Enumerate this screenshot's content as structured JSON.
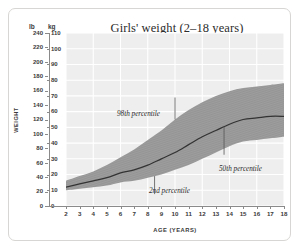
{
  "chart_data": {
    "type": "area",
    "title": "Girls' weight (2–18 years)",
    "xlabel": "AGE (YEARS)",
    "ylabel": "WEIGHT",
    "grid": true,
    "legend_position": "inline-annotations",
    "xlim": [
      2,
      18
    ],
    "x_tick_labels": [
      "2",
      "3",
      "4",
      "5",
      "6",
      "7",
      "8",
      "9",
      "10",
      "11",
      "12",
      "13",
      "14",
      "15",
      "16",
      "17",
      "18"
    ],
    "x": [
      2,
      3,
      4,
      5,
      6,
      7,
      8,
      9,
      10,
      11,
      12,
      13,
      14,
      15,
      16,
      17,
      18
    ],
    "y_axes": [
      {
        "name": "lb",
        "unit_label": "lb",
        "ylim": [
          0,
          240
        ],
        "tick_labels": [
          "240",
          "220",
          "200",
          "180",
          "160",
          "140",
          "120",
          "100",
          "80",
          "60",
          "40",
          "20",
          "0"
        ],
        "ticks": [
          240,
          220,
          200,
          180,
          160,
          140,
          120,
          100,
          80,
          60,
          40,
          20,
          0
        ]
      },
      {
        "name": "kg",
        "unit_label": "kg",
        "ylim": [
          0,
          110
        ],
        "tick_labels": [
          "110",
          "100",
          "90",
          "80",
          "70",
          "60",
          "50",
          "40",
          "30",
          "20",
          "10",
          "0"
        ],
        "ticks": [
          110,
          100,
          90,
          80,
          70,
          60,
          50,
          40,
          30,
          20,
          10,
          0
        ]
      }
    ],
    "series": [
      {
        "name": "98th percentile",
        "unit": "kg",
        "values": [
          16,
          19,
          22,
          26,
          31,
          36,
          42,
          48,
          55,
          61,
          66,
          70,
          73,
          75,
          76,
          77,
          78
        ]
      },
      {
        "name": "50th percentile",
        "unit": "kg",
        "values": [
          12,
          14,
          16,
          18,
          21,
          23,
          26,
          30,
          34,
          39,
          44,
          48,
          52,
          55,
          56,
          57,
          57
        ]
      },
      {
        "name": "2nd percentile",
        "unit": "kg",
        "values": [
          10,
          11,
          12,
          13,
          15,
          16,
          18,
          20,
          23,
          26,
          30,
          34,
          38,
          41,
          42,
          43,
          44
        ]
      }
    ],
    "annotations": [
      {
        "text": "98th percentile",
        "points_to_series": "98th percentile",
        "at_age": 10
      },
      {
        "text": "2nd percentile",
        "points_to_series": "2nd percentile",
        "at_age": 8.5
      },
      {
        "text": "50th percentile",
        "points_to_series": "50th percentile",
        "at_age": 13.6
      }
    ],
    "colors": {
      "plot_background": "#eeeeee",
      "gridline": "#ffffff",
      "band_fill": "#9a9a9a",
      "median_line": "#333333",
      "axis": "#8a8a8a",
      "text": "#3a3a3a"
    }
  }
}
